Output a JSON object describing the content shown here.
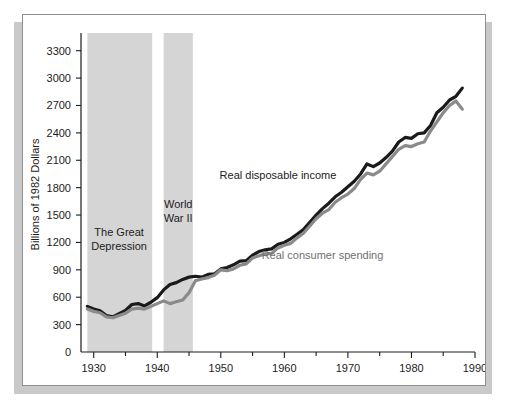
{
  "figure": {
    "panel_background": "#ffffff",
    "panel_border_color": "#8d8d8d",
    "shadow_color": "#c9c9c9"
  },
  "chart_data": {
    "type": "line",
    "title": "",
    "subtitle": "",
    "xlabel": "",
    "ylabel": "Billions of 1982 Dollars",
    "xlim": [
      1928,
      1990
    ],
    "ylim": [
      0,
      3450
    ],
    "grid": false,
    "legend_position": "inline-annotations",
    "y_ticks": [
      0,
      300,
      600,
      900,
      1200,
      1500,
      1800,
      2100,
      2400,
      2700,
      3000,
      3300
    ],
    "y_tick_labels": [
      "0",
      "300",
      "600",
      "900",
      "1200",
      "1500",
      "1800",
      "2100",
      "2400",
      "2700",
      "3000",
      "3300"
    ],
    "x_ticks_major": [
      1930,
      1940,
      1950,
      1960,
      1970,
      1980,
      1990
    ],
    "x_tick_labels": [
      "1930",
      "1940",
      "1950",
      "1960",
      "1970",
      "1980",
      "1990"
    ],
    "x_ticks_minor": [
      1935,
      1945,
      1955,
      1965,
      1975,
      1985
    ],
    "x": [
      1929,
      1930,
      1931,
      1932,
      1933,
      1934,
      1935,
      1936,
      1937,
      1938,
      1939,
      1940,
      1941,
      1942,
      1943,
      1944,
      1945,
      1946,
      1947,
      1948,
      1949,
      1950,
      1951,
      1952,
      1953,
      1954,
      1955,
      1956,
      1957,
      1958,
      1959,
      1960,
      1961,
      1962,
      1963,
      1964,
      1965,
      1966,
      1967,
      1968,
      1969,
      1970,
      1971,
      1972,
      1973,
      1974,
      1975,
      1976,
      1977,
      1978,
      1979,
      1980,
      1981,
      1982,
      1983,
      1984,
      1985,
      1986,
      1987,
      1988
    ],
    "series": [
      {
        "name": "Real disposable income",
        "color": "#1a1a1a",
        "width": 3.2,
        "label_x": 1959,
        "label_y": 1900,
        "values": [
          500,
          470,
          450,
          400,
          385,
          420,
          455,
          520,
          530,
          505,
          545,
          595,
          680,
          740,
          760,
          795,
          820,
          830,
          820,
          850,
          855,
          910,
          925,
          955,
          995,
          1000,
          1060,
          1100,
          1120,
          1130,
          1180,
          1200,
          1240,
          1290,
          1340,
          1420,
          1500,
          1570,
          1630,
          1700,
          1750,
          1810,
          1870,
          1950,
          2060,
          2030,
          2070,
          2130,
          2200,
          2300,
          2350,
          2340,
          2390,
          2400,
          2480,
          2620,
          2680,
          2760,
          2800,
          2890
        ]
      },
      {
        "name": "Real consumer spending",
        "color": "#8a8a8a",
        "width": 3.2,
        "label_x": 1966,
        "label_y": 1020,
        "values": [
          470,
          445,
          430,
          385,
          375,
          400,
          425,
          470,
          480,
          470,
          500,
          530,
          560,
          530,
          550,
          570,
          650,
          780,
          800,
          815,
          840,
          900,
          890,
          910,
          950,
          965,
          1030,
          1055,
          1075,
          1080,
          1140,
          1170,
          1190,
          1250,
          1300,
          1380,
          1460,
          1520,
          1560,
          1640,
          1690,
          1730,
          1790,
          1890,
          1960,
          1940,
          1980,
          2060,
          2140,
          2220,
          2260,
          2250,
          2280,
          2300,
          2420,
          2520,
          2620,
          2700,
          2750,
          2660
        ]
      }
    ],
    "bands": [
      {
        "name": "The Great Depression",
        "label_lines": [
          "The Great",
          "Depression"
        ],
        "start": 1929,
        "end": 1939.2,
        "color": "#d5d5d5",
        "label_x": 1934,
        "label_y": 1270
      },
      {
        "name": "World War II",
        "label_lines": [
          "World",
          "War II"
        ],
        "start": 1941,
        "end": 1945.6,
        "color": "#d5d5d5",
        "label_x": 1943.3,
        "label_y": 1580
      }
    ]
  }
}
